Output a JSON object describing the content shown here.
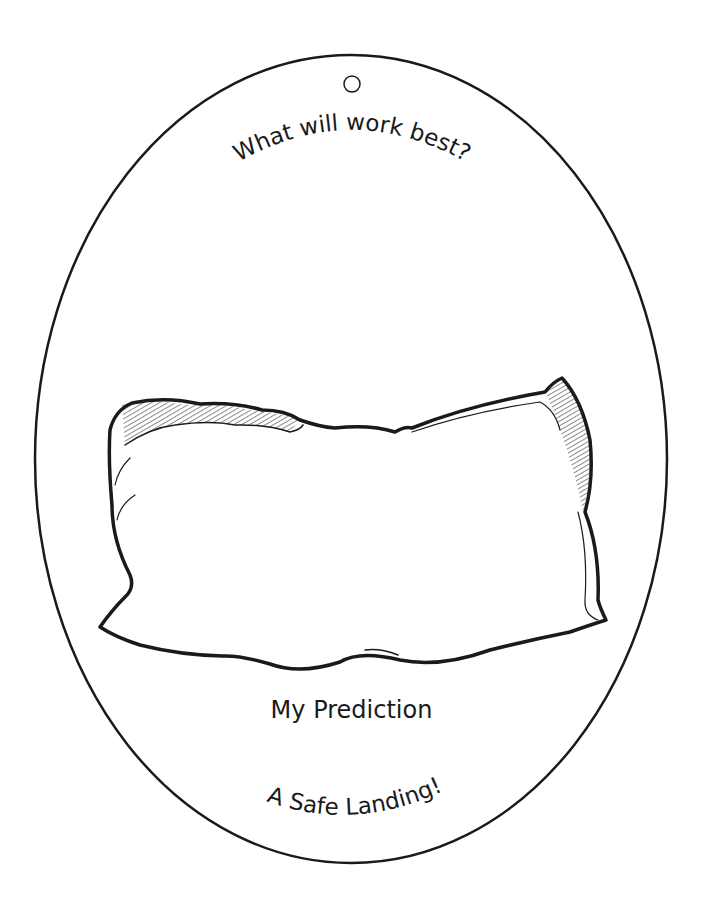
{
  "worksheet": {
    "top_title": "What will work best?",
    "prediction_label": "My Prediction",
    "bottom_title": "A Safe Landing!",
    "illustration": "pillow-icon",
    "hang_hole": "hole-punch-circle",
    "colors": {
      "ink": "#1a1a1a",
      "paper": "#ffffff"
    }
  }
}
